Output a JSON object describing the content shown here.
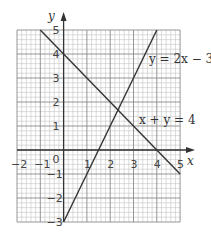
{
  "chart_data": {
    "type": "line",
    "title": "",
    "xlabel": "x",
    "ylabel": "y",
    "xlim": [
      -2,
      5
    ],
    "ylim": [
      -3,
      5
    ],
    "grid": true,
    "minor_divisions_per_unit": 5,
    "x_ticks": [
      "-2",
      "-1",
      "0",
      "1",
      "2",
      "3",
      "4",
      "5"
    ],
    "y_ticks": [
      "5",
      "4",
      "3",
      "2",
      "1",
      "-1",
      "-2",
      "-3"
    ],
    "series": [
      {
        "name": "y = 2x − 3",
        "label": "y = 2x − 3",
        "x": [
          0,
          4
        ],
        "y": [
          -3,
          5
        ]
      },
      {
        "name": "x + y = 4",
        "label": "x + y = 4",
        "x": [
          -1,
          5
        ],
        "y": [
          5,
          -1
        ]
      }
    ],
    "intersection": {
      "x": 2.33,
      "y": 1.67
    },
    "colors": {
      "line": "#333333",
      "major_grid": "#8a8a8a",
      "minor_grid": "#c4c4c4",
      "axis": "#333333"
    }
  },
  "labels": {
    "x_axis": "x",
    "y_axis": "y",
    "line1": "y = 2x − 3",
    "line2": "x + y = 4",
    "origin": "0"
  }
}
